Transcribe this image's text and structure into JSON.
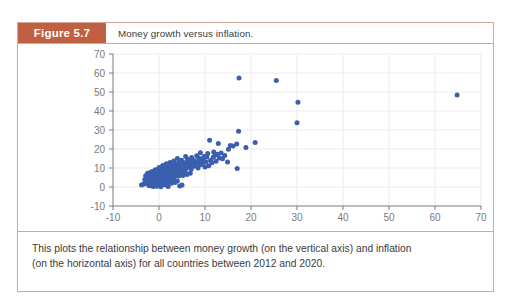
{
  "figure": {
    "number_label": "Figure 5.7",
    "title": "Money growth versus inflation.",
    "caption_line_1": "This plots the relationship between money growth (on the vertical axis) and inflation",
    "caption_line_2": "(on the horizontal axis) for all countries between 2012 and 2020."
  },
  "colors": {
    "header_bar": "#bf6042",
    "frame_border": "#d8a894",
    "point": "#3b5fae",
    "axis": "#7a7a7a",
    "grid": "#ebebeb",
    "text": "#3b3b3b"
  },
  "chart_data": {
    "type": "scatter",
    "title": "Money growth versus inflation.",
    "xlabel": "",
    "ylabel": "",
    "xlim": [
      -10,
      70
    ],
    "ylim": [
      -10,
      70
    ],
    "xticks": [
      -10,
      0,
      10,
      20,
      30,
      40,
      50,
      60,
      70
    ],
    "yticks": [
      -10,
      0,
      10,
      20,
      30,
      40,
      50,
      60,
      70
    ],
    "grid": true,
    "legend": null,
    "series": [
      {
        "name": "Countries, 2012-2020",
        "marker": "circle",
        "color": "#3b5fae",
        "points": [
          [
            17.4,
            57.4
          ],
          [
            25.5,
            56.0
          ],
          [
            64.8,
            48.4
          ],
          [
            30.2,
            44.6
          ],
          [
            30.0,
            33.8
          ],
          [
            17.3,
            29.4
          ],
          [
            16.9,
            22.6
          ],
          [
            20.9,
            23.4
          ],
          [
            18.9,
            20.8
          ],
          [
            15.5,
            21.9
          ],
          [
            11.0,
            24.6
          ],
          [
            12.9,
            22.9
          ],
          [
            16.1,
            21.6
          ],
          [
            17.0,
            9.7
          ],
          [
            13.5,
            17.9
          ],
          [
            13.8,
            14.9
          ],
          [
            15.1,
            19.9
          ],
          [
            11.8,
            15.6
          ],
          [
            12.4,
            13.6
          ],
          [
            11.2,
            13.9
          ],
          [
            10.4,
            15.8
          ],
          [
            9.8,
            16.1
          ],
          [
            9.1,
            14.7
          ],
          [
            8.6,
            15.2
          ],
          [
            8.2,
            16.4
          ],
          [
            7.6,
            14.0
          ],
          [
            7.1,
            15.5
          ],
          [
            6.7,
            13.2
          ],
          [
            6.2,
            14.6
          ],
          [
            5.8,
            16.0
          ],
          [
            5.3,
            12.8
          ],
          [
            4.9,
            14.1
          ],
          [
            4.4,
            13.4
          ],
          [
            4.0,
            15.0
          ],
          [
            3.6,
            12.1
          ],
          [
            3.2,
            13.7
          ],
          [
            2.8,
            11.4
          ],
          [
            2.4,
            12.9
          ],
          [
            2.0,
            10.8
          ],
          [
            1.6,
            12.2
          ],
          [
            1.2,
            9.9
          ],
          [
            0.8,
            11.3
          ],
          [
            0.4,
            8.8
          ],
          [
            0.0,
            10.2
          ],
          [
            -0.4,
            7.6
          ],
          [
            -0.8,
            9.1
          ],
          [
            -1.2,
            6.4
          ],
          [
            -1.6,
            8.0
          ],
          [
            -2.0,
            5.1
          ],
          [
            9.4,
            12.4
          ],
          [
            8.9,
            11.7
          ],
          [
            8.3,
            12.9
          ],
          [
            7.8,
            11.0
          ],
          [
            7.3,
            12.3
          ],
          [
            6.9,
            10.4
          ],
          [
            6.4,
            11.6
          ],
          [
            5.9,
            9.8
          ],
          [
            5.5,
            10.9
          ],
          [
            5.0,
            9.2
          ],
          [
            4.6,
            10.3
          ],
          [
            4.1,
            8.6
          ],
          [
            3.7,
            9.7
          ],
          [
            3.3,
            8.0
          ],
          [
            2.9,
            9.1
          ],
          [
            2.5,
            7.4
          ],
          [
            2.1,
            8.5
          ],
          [
            1.7,
            6.8
          ],
          [
            1.3,
            7.9
          ],
          [
            0.9,
            6.2
          ],
          [
            0.5,
            7.3
          ],
          [
            0.1,
            5.6
          ],
          [
            -0.3,
            6.7
          ],
          [
            -0.7,
            5.0
          ],
          [
            -1.1,
            6.1
          ],
          [
            -1.5,
            4.4
          ],
          [
            -1.9,
            5.5
          ],
          [
            -2.3,
            3.8
          ],
          [
            -2.6,
            4.9
          ],
          [
            10.2,
            13.1
          ],
          [
            9.6,
            14.3
          ],
          [
            8.7,
            13.6
          ],
          [
            7.9,
            13.0
          ],
          [
            7.2,
            13.8
          ],
          [
            6.6,
            12.5
          ],
          [
            6.0,
            13.1
          ],
          [
            5.4,
            11.9
          ],
          [
            4.8,
            12.6
          ],
          [
            4.2,
            11.4
          ],
          [
            3.8,
            12.0
          ],
          [
            3.4,
            10.7
          ],
          [
            3.0,
            11.5
          ],
          [
            2.6,
            10.1
          ],
          [
            2.2,
            10.9
          ],
          [
            1.8,
            9.5
          ],
          [
            1.4,
            10.3
          ],
          [
            1.0,
            8.9
          ],
          [
            0.6,
            9.6
          ],
          [
            0.2,
            8.3
          ],
          [
            -0.2,
            9.0
          ],
          [
            -0.6,
            7.7
          ],
          [
            -1.0,
            8.4
          ],
          [
            -1.4,
            7.1
          ],
          [
            -1.8,
            7.8
          ],
          [
            -2.2,
            6.5
          ],
          [
            -2.5,
            7.2
          ],
          [
            -2.9,
            5.9
          ],
          [
            11.5,
            12.8
          ],
          [
            10.8,
            11.2
          ],
          [
            10.0,
            10.5
          ],
          [
            9.2,
            11.8
          ],
          [
            8.5,
            10.0
          ],
          [
            7.7,
            11.1
          ],
          [
            7.0,
            9.4
          ],
          [
            6.3,
            10.6
          ],
          [
            5.6,
            8.8
          ],
          [
            5.1,
            9.9
          ],
          [
            4.5,
            8.2
          ],
          [
            3.9,
            9.3
          ],
          [
            3.5,
            7.6
          ],
          [
            3.1,
            8.7
          ],
          [
            2.7,
            7.0
          ],
          [
            2.3,
            8.1
          ],
          [
            1.9,
            6.4
          ],
          [
            1.5,
            7.5
          ],
          [
            1.1,
            5.8
          ],
          [
            0.7,
            6.9
          ],
          [
            0.3,
            5.2
          ],
          [
            -0.1,
            6.3
          ],
          [
            -0.5,
            4.6
          ],
          [
            -0.9,
            5.7
          ],
          [
            -1.3,
            4.0
          ],
          [
            -1.7,
            5.1
          ],
          [
            -2.1,
            3.4
          ],
          [
            -2.4,
            4.5
          ],
          [
            -2.8,
            2.8
          ],
          [
            -3.1,
            3.9
          ],
          [
            6.8,
            7.3
          ],
          [
            6.1,
            6.6
          ],
          [
            5.7,
            7.8
          ],
          [
            5.2,
            6.1
          ],
          [
            4.7,
            7.1
          ],
          [
            4.3,
            5.8
          ],
          [
            3.9,
            6.8
          ],
          [
            3.4,
            5.4
          ],
          [
            3.0,
            6.4
          ],
          [
            2.6,
            5.0
          ],
          [
            2.2,
            6.0
          ],
          [
            1.8,
            4.6
          ],
          [
            1.4,
            5.6
          ],
          [
            1.0,
            4.2
          ],
          [
            0.6,
            5.2
          ],
          [
            0.2,
            3.8
          ],
          [
            -0.2,
            4.8
          ],
          [
            -0.6,
            3.4
          ],
          [
            -1.0,
            4.4
          ],
          [
            -1.4,
            3.0
          ],
          [
            -1.8,
            4.0
          ],
          [
            -2.2,
            2.6
          ],
          [
            -2.6,
            3.6
          ],
          [
            -3.0,
            2.2
          ],
          [
            4.0,
            3.1
          ],
          [
            3.5,
            2.4
          ],
          [
            3.1,
            3.4
          ],
          [
            2.7,
            2.0
          ],
          [
            2.3,
            3.0
          ],
          [
            1.9,
            1.6
          ],
          [
            1.5,
            2.6
          ],
          [
            1.1,
            1.2
          ],
          [
            0.7,
            2.2
          ],
          [
            0.3,
            0.8
          ],
          [
            -0.1,
            1.8
          ],
          [
            -0.5,
            0.4
          ],
          [
            -0.9,
            1.4
          ],
          [
            -1.3,
            0.2
          ],
          [
            -1.7,
            1.0
          ],
          [
            -2.1,
            0.6
          ],
          [
            -2.5,
            1.5
          ],
          [
            -3.4,
            1.5
          ],
          [
            -3.8,
            1.1
          ],
          [
            5.0,
            1.0
          ],
          [
            4.5,
            0.5
          ],
          [
            2.0,
            0.3
          ],
          [
            0.4,
            0.1
          ],
          [
            1.7,
            0.9
          ],
          [
            12.2,
            16.9
          ],
          [
            13.1,
            15.2
          ],
          [
            14.3,
            16.6
          ],
          [
            14.9,
            13.2
          ],
          [
            11.9,
            18.4
          ],
          [
            12.7,
            17.2
          ],
          [
            10.6,
            17.6
          ],
          [
            9.0,
            18.0
          ]
        ]
      }
    ]
  }
}
